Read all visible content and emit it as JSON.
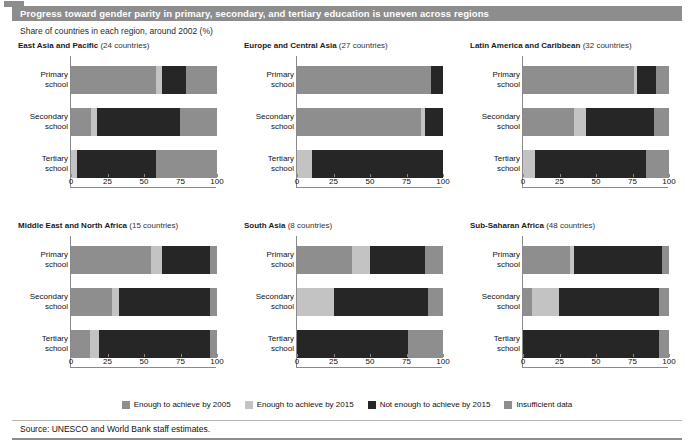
{
  "figure": {
    "tag_icon": "figure-number-block",
    "title": "Progress toward gender parity in primary, secondary, and tertiary education is uneven across regions",
    "subtitle": "Share of countries in each region, around 2002 (%)",
    "source": "Source: UNESCO and World Bank staff estimates."
  },
  "legend": {
    "items": [
      {
        "label": "Enough to achieve by 2005",
        "color": "#8e8e8e"
      },
      {
        "label": "Enough to achieve by 2015",
        "color": "#c3c3c3"
      },
      {
        "label": "Not enough to achieve by 2015",
        "color": "#262626"
      },
      {
        "label": "Insufficient data",
        "color": "#8e8e8e"
      }
    ]
  },
  "axis": {
    "ticks": [
      0,
      25,
      50,
      75,
      100
    ],
    "tick_labels": [
      "0",
      "25",
      "50",
      "75",
      "100"
    ],
    "min": 0,
    "max": 100
  },
  "categories": [
    "Primary school",
    "Secondary school",
    "Tertiary school"
  ],
  "category_lines": [
    [
      "Primary",
      "school"
    ],
    [
      "Secondary",
      "school"
    ],
    [
      "Tertiary",
      "school"
    ]
  ],
  "chart_data": {
    "type": "bar",
    "orientation": "horizontal",
    "stacked": true,
    "title": "Progress toward gender parity in primary, secondary, and tertiary education is uneven across regions",
    "subtitle": "Share of countries in each region, around 2002 (%)",
    "xlabel": "Share of countries in each region, around 2002 (%)",
    "ylabel": "",
    "xlim": [
      0,
      100
    ],
    "grid": false,
    "legend_position": "bottom",
    "categories": [
      "Primary school",
      "Secondary school",
      "Tertiary school"
    ],
    "series": [
      {
        "name": "Enough to achieve by 2005",
        "color": "#8e8e8e"
      },
      {
        "name": "Enough to achieve by 2015",
        "color": "#c3c3c3"
      },
      {
        "name": "Not enough to achieve by 2015",
        "color": "#262626"
      },
      {
        "name": "Insufficient data",
        "color": "#8e8e8e"
      }
    ],
    "panels": [
      {
        "region": "East Asia and Pacific",
        "countries_note": "(24 countries)",
        "countries": 24,
        "bars": [
          {
            "category": "Primary school",
            "values": [
              58,
              4,
              17,
              21
            ]
          },
          {
            "category": "Secondary school",
            "values": [
              14,
              4,
              57,
              25
            ]
          },
          {
            "category": "Tertiary school",
            "values": [
              0,
              4,
              54,
              42
            ]
          }
        ]
      },
      {
        "region": "Europe and Central Asia",
        "countries_note": "(27 countries)",
        "countries": 27,
        "bars": [
          {
            "category": "Primary school",
            "values": [
              92,
              0,
              8,
              0
            ]
          },
          {
            "category": "Secondary school",
            "values": [
              85,
              3,
              12,
              0
            ]
          },
          {
            "category": "Tertiary school",
            "values": [
              0,
              10,
              90,
              0
            ]
          }
        ]
      },
      {
        "region": "Latin America and Caribbean",
        "countries_note": "(32 countries)",
        "countries": 32,
        "bars": [
          {
            "category": "Primary school",
            "values": [
              76,
              2,
              13,
              9
            ]
          },
          {
            "category": "Secondary school",
            "values": [
              35,
              8,
              47,
              10
            ]
          },
          {
            "category": "Tertiary school",
            "values": [
              0,
              8,
              76,
              16
            ]
          }
        ]
      },
      {
        "region": "Middle East and North Africa",
        "countries_note": "(15 countries)",
        "countries": 15,
        "bars": [
          {
            "category": "Primary school",
            "values": [
              55,
              7,
              33,
              5
            ]
          },
          {
            "category": "Secondary school",
            "values": [
              28,
              5,
              62,
              5
            ]
          },
          {
            "category": "Tertiary school",
            "values": [
              13,
              6,
              76,
              5
            ]
          }
        ]
      },
      {
        "region": "South Asia",
        "countries_note": "(8 countries)",
        "countries": 8,
        "bars": [
          {
            "category": "Primary school",
            "values": [
              38,
              12,
              38,
              12
            ]
          },
          {
            "category": "Secondary school",
            "values": [
              0,
              25,
              65,
              10
            ]
          },
          {
            "category": "Tertiary school",
            "values": [
              0,
              0,
              76,
              24
            ]
          }
        ]
      },
      {
        "region": "Sub-Saharan Africa",
        "countries_note": "(48 countries)",
        "countries": 48,
        "bars": [
          {
            "category": "Primary school",
            "values": [
              32,
              3,
              60,
              5
            ]
          },
          {
            "category": "Secondary school",
            "values": [
              6,
              19,
              68,
              7
            ]
          },
          {
            "category": "Tertiary school",
            "values": [
              0,
              0,
              93,
              7
            ]
          }
        ]
      }
    ]
  }
}
